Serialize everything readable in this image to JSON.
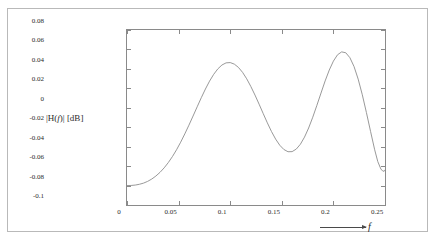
{
  "figure": {
    "background_color": "#ffffff",
    "outer_border_color": "#b9b9b9",
    "axis_color": "#8a8a8a",
    "curve_color": "#8d8d8d",
    "text_color": "#2b2b2b"
  },
  "axis_titles": {
    "y_prefix": "|H(",
    "y_italic": "f",
    "y_suffix": ")| [dB]",
    "x_symbol": "f"
  },
  "chart_data": {
    "type": "line",
    "title": "",
    "subtitle": "",
    "xlabel": "f",
    "ylabel": "|H(f)| [dB]",
    "xlim": [
      0,
      0.25
    ],
    "ylim": [
      -0.1,
      0.08
    ],
    "grid": false,
    "legend": null,
    "x_ticks": [
      0,
      0.05,
      0.1,
      0.15,
      0.2,
      0.25
    ],
    "x_tick_labels": [
      "0",
      "0.05",
      "0.1",
      "0.15",
      "0.2",
      "0.25"
    ],
    "y_ticks": [
      0.08,
      0.06,
      0.04,
      0.02,
      0,
      -0.02,
      -0.04,
      -0.06,
      -0.08,
      -0.1
    ],
    "y_tick_labels": [
      "0.08",
      "0.06",
      "0.04",
      "0.02",
      "0",
      "-0.02",
      "-0.04",
      "-0.06",
      "-0.08",
      "-0.1"
    ],
    "series": [
      {
        "name": "|H(f)|",
        "x": [
          0,
          0.004,
          0.008,
          0.012,
          0.016,
          0.02,
          0.024,
          0.028,
          0.032,
          0.036,
          0.04,
          0.044,
          0.048,
          0.052,
          0.056,
          0.06,
          0.064,
          0.068,
          0.072,
          0.076,
          0.08,
          0.084,
          0.088,
          0.092,
          0.096,
          0.1,
          0.104,
          0.108,
          0.112,
          0.116,
          0.12,
          0.124,
          0.128,
          0.132,
          0.136,
          0.14,
          0.144,
          0.148,
          0.152,
          0.156,
          0.16,
          0.164,
          0.168,
          0.172,
          0.176,
          0.18,
          0.184,
          0.188,
          0.192,
          0.196,
          0.2,
          0.204,
          0.208,
          0.212,
          0.216,
          0.22,
          0.224,
          0.228,
          0.232,
          0.236,
          0.24,
          0.243,
          0.246,
          0.248,
          0.2495,
          0.25
        ],
        "y": [
          -0.08,
          -0.0799,
          -0.0795,
          -0.0787,
          -0.0775,
          -0.0757,
          -0.0733,
          -0.0702,
          -0.0664,
          -0.0618,
          -0.0564,
          -0.0502,
          -0.0432,
          -0.0354,
          -0.0269,
          -0.0179,
          -0.0085,
          0.001,
          0.0104,
          0.0193,
          0.0274,
          0.0344,
          0.04,
          0.044,
          0.0462,
          0.0465,
          0.0449,
          0.0415,
          0.0364,
          0.0298,
          0.0219,
          0.0131,
          0.0037,
          -0.006,
          -0.0155,
          -0.0244,
          -0.0322,
          -0.0385,
          -0.0429,
          -0.0452,
          -0.0451,
          -0.0425,
          -0.0375,
          -0.0302,
          -0.0208,
          -0.0097,
          0.0025,
          0.0152,
          0.0276,
          0.0388,
          0.048,
          0.0545,
          0.0575,
          0.0566,
          0.0515,
          0.0424,
          0.0295,
          0.0134,
          -0.0049,
          -0.0243,
          -0.0432,
          -0.0553,
          -0.063,
          -0.0653,
          -0.065,
          -0.064
        ]
      }
    ],
    "annotations": [
      {
        "text": "peak",
        "x": 0.081,
        "y": 0.075
      },
      {
        "text": "trough",
        "x": 0.149,
        "y": -0.08
      },
      {
        "text": "peak",
        "x": 0.205,
        "y": 0.079
      },
      {
        "text": "trough",
        "x": 0.239,
        "y": -0.075
      },
      {
        "text": "start",
        "x": 0.0,
        "y": -0.08
      }
    ]
  }
}
